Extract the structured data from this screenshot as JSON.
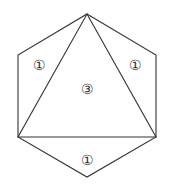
{
  "diagram": {
    "stroke_color": "#333333",
    "vertices": {
      "top": [
        87,
        14
      ],
      "upper_left": [
        18,
        55
      ],
      "upper_right": [
        156,
        55
      ],
      "lower_left": [
        18,
        137
      ],
      "lower_right": [
        156,
        137
      ],
      "bottom": [
        87,
        177
      ]
    },
    "labels": [
      {
        "text": "①",
        "x": 39,
        "y": 70,
        "region": "left-triangle"
      },
      {
        "text": "①",
        "x": 135,
        "y": 70,
        "region": "right-triangle"
      },
      {
        "text": "③",
        "x": 87,
        "y": 94,
        "region": "center-triangle"
      },
      {
        "text": "①",
        "x": 87,
        "y": 165,
        "region": "bottom-triangle"
      }
    ]
  }
}
